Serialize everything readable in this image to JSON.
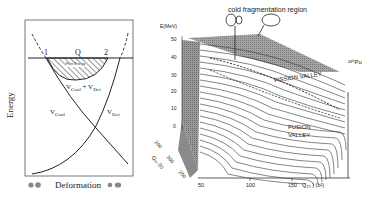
{
  "left_diagram": {
    "y_axis_label": "Energy",
    "x_axis_label": "Deformation",
    "point_1": "1",
    "point_2": "2",
    "q_label": "Q",
    "shaded_region_label": "Free Energy",
    "sum_curve_label": "V",
    "sum_curve_sub1": "Coul",
    "sum_plus": " + V",
    "sum_curve_sub2": "Def",
    "coulomb_label": "V",
    "coulomb_sub": "Coul",
    "deformation_label": "V",
    "deformation_sub": "Def"
  },
  "right_diagram": {
    "title_annotation": "cold fragmentation region",
    "z_axis_label": "E(MeV)",
    "z_ticks": [
      "50",
      "40",
      "30",
      "20",
      "10",
      "0"
    ],
    "nucleus_label": "²³⁶Pu",
    "fission_valley_label": "FISSION VALLEY",
    "fusion_valley_label": "FUSION VALLEY",
    "x_axis_ticks": [
      "50",
      "100",
      "150"
    ],
    "x_axis_label": "Q₂₀ ) (b²)",
    "depth_axis_ticks": [
      "200",
      "300",
      "250"
    ],
    "depth_axis_label": "Q₄₀ (b)"
  }
}
